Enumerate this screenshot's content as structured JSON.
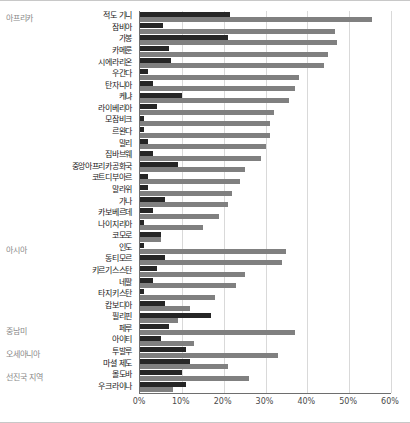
{
  "chart_data": {
    "type": "bar",
    "orientation": "horizontal",
    "title": "",
    "xlabel": "",
    "ylabel": "",
    "xlim": [
      0,
      60
    ],
    "xtick_labels": [
      "0%",
      "10%",
      "20%",
      "30%",
      "40%",
      "50%",
      "60%"
    ],
    "xtick_values": [
      0,
      10,
      20,
      30,
      40,
      50,
      60
    ],
    "grid": true,
    "legend": [],
    "series": [
      {
        "name": "dark-series",
        "color": "#262626"
      },
      {
        "name": "light-series",
        "color": "#808080"
      }
    ],
    "groups": [
      {
        "label": "아프리카",
        "first_row": 0
      },
      {
        "label": "아시아",
        "first_row": 20
      },
      {
        "label": "중남미",
        "first_row": 27
      },
      {
        "label": "오세아니아",
        "first_row": 29
      },
      {
        "label": "선진국 지역",
        "first_row": 31
      }
    ],
    "categories": [
      "적도 기니",
      "잠비아",
      "가봉",
      "카메룬",
      "시에라리온",
      "우간다",
      "탄자니아",
      "케냐",
      "라이베리아",
      "모잠비크",
      "르완다",
      "말리",
      "짐바브웨",
      "중앙아프리카공화국",
      "코트디부아르",
      "말라위",
      "가나",
      "카보베르데",
      "나이지리아",
      "코모로",
      "인도",
      "동티모르",
      "키르기스스탄",
      "네팔",
      "타지키스탄",
      "캄보디아",
      "필리핀",
      "페루",
      "아이티",
      "투발루",
      "마셜 제도",
      "몰도바",
      "우크라이나"
    ],
    "values_dark": [
      21.5,
      5.5,
      21.0,
      7.0,
      7.5,
      2.0,
      3.0,
      10.0,
      4.0,
      1.0,
      1.0,
      2.0,
      3.0,
      9.0,
      2.0,
      2.0,
      6.0,
      3.0,
      1.0,
      5.0,
      1.0,
      6.0,
      4.0,
      3.0,
      1.0,
      6.0,
      17.0,
      7.0,
      5.0,
      11.0,
      12.0,
      10.0,
      11.0
    ],
    "values_light": [
      55.5,
      46.5,
      47.0,
      45.0,
      44.0,
      38.0,
      37.0,
      35.5,
      32.0,
      31.0,
      31.0,
      30.0,
      29.0,
      25.0,
      24.0,
      22.0,
      21.0,
      19.0,
      15.0,
      5.0,
      35.0,
      34.0,
      25.0,
      23.0,
      18.0,
      12.0,
      9.0,
      37.0,
      13.0,
      33.0,
      21.0,
      26.0,
      8.0
    ]
  }
}
